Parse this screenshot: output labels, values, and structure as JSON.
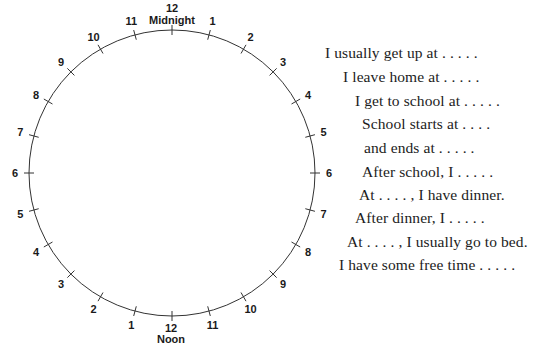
{
  "diagram": {
    "type": "24-hour-clock-worksheet",
    "clock": {
      "center": [
        172,
        173
      ],
      "radius": 143,
      "label_radius": 157,
      "tick_half_length": 5,
      "stroke_color": "#333333",
      "top_label": {
        "number": "12",
        "caption": "Midnight"
      },
      "bottom_label": {
        "number": "12",
        "caption": "Noon"
      },
      "right_side_labels": [
        "1",
        "2",
        "3",
        "4",
        "5",
        "6",
        "7",
        "8",
        "9",
        "10",
        "11"
      ],
      "left_side_labels": [
        "1",
        "2",
        "3",
        "4",
        "5",
        "6",
        "7",
        "8",
        "9",
        "10",
        "11"
      ]
    },
    "prompts": [
      {
        "text": "I usually get up at . . . . .",
        "x": 325,
        "y": 44
      },
      {
        "text": "I leave home at . . . . .",
        "x": 343,
        "y": 68
      },
      {
        "text": "I get to school at . . . . .",
        "x": 355,
        "y": 92
      },
      {
        "text": "School starts at . . . .",
        "x": 362,
        "y": 115
      },
      {
        "text": "and ends at . . . . .",
        "x": 364,
        "y": 139
      },
      {
        "text": "After school, I . . . . .",
        "x": 362,
        "y": 163
      },
      {
        "text": "At . . . . , I have dinner.",
        "x": 359,
        "y": 186
      },
      {
        "text": "After dinner, I . . . . .",
        "x": 355,
        "y": 209
      },
      {
        "text": "At . . . . , I usually go to bed.",
        "x": 347,
        "y": 233
      },
      {
        "text": "I have some free time . . . . .",
        "x": 339,
        "y": 256
      }
    ]
  }
}
